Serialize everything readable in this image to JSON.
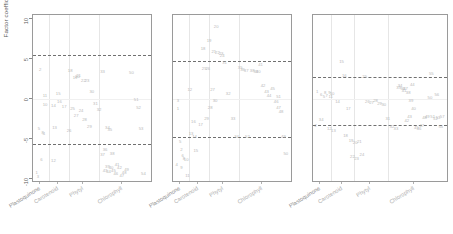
{
  "figure": {
    "ylabel": "Factor coefficient",
    "y_ticks": [
      "10",
      "5",
      "0",
      "-5",
      "-10"
    ],
    "y_tick_values": [
      10,
      5,
      0,
      -5,
      -10
    ],
    "ylim": [
      -10.5,
      10.5
    ],
    "x_categories": [
      "Plastoquinone",
      "Carotenoid",
      "Phytyl",
      "Chlorophyll"
    ],
    "panel_count": 3,
    "colors": {
      "point": "#b9b9b9",
      "frame": "#9a9a9a",
      "gridline": "#e6e6e6",
      "threshold_line": "#707070",
      "axis_text": "#5a5a5a",
      "xlabel_text": "#b0b0b0"
    }
  },
  "chart_data": {
    "type": "scatter",
    "title": "",
    "xlabel": "",
    "ylabel": "Factor coefficient",
    "ylim": [
      -10.5,
      10.5
    ],
    "grid": true,
    "legend": "none",
    "categories": [
      "Plastoquinone",
      "Carotenoid",
      "Phytyl",
      "Chlorophyll"
    ],
    "panels": [
      {
        "name": "Factor 1",
        "thresholds": [
          5.5,
          -5.6
        ],
        "points": [
          {
            "label": "2",
            "x": 0.06,
            "y": 3.6
          },
          {
            "label": "11",
            "x": 0.1,
            "y": 0.4
          },
          {
            "label": "10",
            "x": 0.1,
            "y": -0.8
          },
          {
            "label": "5",
            "x": 0.05,
            "y": -3.8
          },
          {
            "label": "1",
            "x": 0.03,
            "y": -9.2
          },
          {
            "label": "3",
            "x": 0.04,
            "y": -9.8
          },
          {
            "label": "6",
            "x": 0.07,
            "y": -7.6
          },
          {
            "label": "8",
            "x": 0.08,
            "y": -4.2
          },
          {
            "label": "4",
            "x": 0.09,
            "y": -4.4
          },
          {
            "label": "12",
            "x": 0.17,
            "y": -7.8
          },
          {
            "label": "13",
            "x": 0.18,
            "y": -3.6
          },
          {
            "label": "14",
            "x": 0.17,
            "y": -0.9
          },
          {
            "label": "15",
            "x": 0.21,
            "y": 0.6
          },
          {
            "label": "16",
            "x": 0.22,
            "y": -0.4
          },
          {
            "label": "17",
            "x": 0.26,
            "y": -1.0
          },
          {
            "label": "18",
            "x": 0.31,
            "y": 3.5
          },
          {
            "label": "19",
            "x": 0.35,
            "y": 2.6
          },
          {
            "label": "20",
            "x": 0.37,
            "y": 2.8
          },
          {
            "label": "21",
            "x": 0.38,
            "y": 2.9
          },
          {
            "label": "22",
            "x": 0.42,
            "y": 2.2
          },
          {
            "label": "23",
            "x": 0.45,
            "y": 2.3
          },
          {
            "label": "24",
            "x": 0.4,
            "y": -1.5
          },
          {
            "label": "25",
            "x": 0.33,
            "y": -1.3
          },
          {
            "label": "26",
            "x": 0.3,
            "y": -4.0
          },
          {
            "label": "27",
            "x": 0.36,
            "y": -2.1
          },
          {
            "label": "28",
            "x": 0.43,
            "y": -2.6
          },
          {
            "label": "29",
            "x": 0.47,
            "y": -3.5
          },
          {
            "label": "30",
            "x": 0.49,
            "y": 0.9
          },
          {
            "label": "31",
            "x": 0.52,
            "y": -0.6
          },
          {
            "label": "32",
            "x": 0.55,
            "y": -1.4
          },
          {
            "label": "33",
            "x": 0.58,
            "y": 3.4
          },
          {
            "label": "34",
            "x": 0.62,
            "y": -3.6
          },
          {
            "label": "35",
            "x": 0.64,
            "y": -3.9
          },
          {
            "label": "36",
            "x": 0.6,
            "y": -6.4
          },
          {
            "label": "37",
            "x": 0.58,
            "y": -7.0
          },
          {
            "label": "38",
            "x": 0.66,
            "y": -6.9
          },
          {
            "label": "39",
            "x": 0.62,
            "y": -8.5
          },
          {
            "label": "40",
            "x": 0.65,
            "y": -8.6
          },
          {
            "label": "41",
            "x": 0.7,
            "y": -8.3
          },
          {
            "label": "42",
            "x": 0.72,
            "y": -8.6
          },
          {
            "label": "43",
            "x": 0.6,
            "y": -9.0
          },
          {
            "label": "44",
            "x": 0.63,
            "y": -9.1
          },
          {
            "label": "45",
            "x": 0.67,
            "y": -9.0
          },
          {
            "label": "46",
            "x": 0.69,
            "y": -9.4
          },
          {
            "label": "47",
            "x": 0.74,
            "y": -9.6
          },
          {
            "label": "48",
            "x": 0.76,
            "y": -9.3
          },
          {
            "label": "49",
            "x": 0.78,
            "y": -8.9
          },
          {
            "label": "50",
            "x": 0.82,
            "y": 3.3
          },
          {
            "label": "51",
            "x": 0.86,
            "y": -0.1
          },
          {
            "label": "52",
            "x": 0.88,
            "y": -1.1
          },
          {
            "label": "53",
            "x": 0.9,
            "y": -3.7
          },
          {
            "label": "54",
            "x": 0.92,
            "y": -9.4
          }
        ]
      },
      {
        "name": "Factor 2",
        "thresholds": [
          4.7,
          -4.7
        ],
        "points": [
          {
            "label": "3",
            "x": 0.04,
            "y": -0.2
          },
          {
            "label": "1",
            "x": 0.04,
            "y": -1.3
          },
          {
            "label": "5",
            "x": 0.06,
            "y": -5.4
          },
          {
            "label": "2",
            "x": 0.07,
            "y": -6.4
          },
          {
            "label": "6",
            "x": 0.08,
            "y": -7.1
          },
          {
            "label": "4",
            "x": 0.03,
            "y": -8.2
          },
          {
            "label": "8",
            "x": 0.09,
            "y": -7.5
          },
          {
            "label": "9",
            "x": 0.07,
            "y": -8.6
          },
          {
            "label": "10",
            "x": 0.11,
            "y": -7.6
          },
          {
            "label": "11",
            "x": 0.12,
            "y": -9.6
          },
          {
            "label": "12",
            "x": 0.14,
            "y": 1.1
          },
          {
            "label": "13",
            "x": 0.15,
            "y": -4.4
          },
          {
            "label": "14",
            "x": 0.18,
            "y": -4.8
          },
          {
            "label": "15",
            "x": 0.19,
            "y": -6.5
          },
          {
            "label": "16",
            "x": 0.17,
            "y": -2.9
          },
          {
            "label": "17",
            "x": 0.23,
            "y": -3.3
          },
          {
            "label": "18",
            "x": 0.25,
            "y": 6.3
          },
          {
            "label": "19",
            "x": 0.3,
            "y": 7.3
          },
          {
            "label": "20",
            "x": 0.36,
            "y": 9.0
          },
          {
            "label": "21",
            "x": 0.34,
            "y": 5.9
          },
          {
            "label": "22",
            "x": 0.37,
            "y": 5.8
          },
          {
            "label": "23",
            "x": 0.4,
            "y": 5.6
          },
          {
            "label": "24",
            "x": 0.41,
            "y": 5.4
          },
          {
            "label": "25",
            "x": 0.26,
            "y": 3.8
          },
          {
            "label": "26",
            "x": 0.29,
            "y": 3.7
          },
          {
            "label": "27",
            "x": 0.33,
            "y": 1.1
          },
          {
            "label": "28",
            "x": 0.31,
            "y": -1.1
          },
          {
            "label": "29",
            "x": 0.28,
            "y": -2.5
          },
          {
            "label": "30",
            "x": 0.35,
            "y": -0.3
          },
          {
            "label": "31",
            "x": 0.43,
            "y": 4.5
          },
          {
            "label": "32",
            "x": 0.46,
            "y": 0.6
          },
          {
            "label": "33",
            "x": 0.5,
            "y": -2.5
          },
          {
            "label": "34",
            "x": 0.53,
            "y": -4.7
          },
          {
            "label": "35",
            "x": 0.56,
            "y": 3.9
          },
          {
            "label": "36",
            "x": 0.58,
            "y": 3.6
          },
          {
            "label": "37",
            "x": 0.61,
            "y": 3.5
          },
          {
            "label": "38",
            "x": 0.66,
            "y": 3.5
          },
          {
            "label": "39",
            "x": 0.69,
            "y": 3.4
          },
          {
            "label": "40",
            "x": 0.71,
            "y": 3.4
          },
          {
            "label": "41",
            "x": 0.73,
            "y": 4.3
          },
          {
            "label": "42",
            "x": 0.75,
            "y": 1.6
          },
          {
            "label": "43",
            "x": 0.78,
            "y": 0.9
          },
          {
            "label": "44",
            "x": 0.8,
            "y": 0.4
          },
          {
            "label": "45",
            "x": 0.83,
            "y": 1.3
          },
          {
            "label": "46",
            "x": 0.86,
            "y": -0.4
          },
          {
            "label": "47",
            "x": 0.88,
            "y": -1.1
          },
          {
            "label": "48",
            "x": 0.9,
            "y": -1.6
          },
          {
            "label": "49",
            "x": 0.92,
            "y": -4.8
          },
          {
            "label": "50",
            "x": 0.94,
            "y": -6.9
          },
          {
            "label": "51",
            "x": 0.88,
            "y": 0.3
          },
          {
            "label": "52",
            "x": 0.62,
            "y": -4.8
          }
        ]
      },
      {
        "name": "Factor 3",
        "thresholds": [
          2.8,
          -3.3
        ],
        "points": [
          {
            "label": "1",
            "x": 0.03,
            "y": 0.9
          },
          {
            "label": "2",
            "x": 0.02,
            "y": -3.4
          },
          {
            "label": "3",
            "x": 0.05,
            "y": -2.6
          },
          {
            "label": "4",
            "x": 0.07,
            "y": -2.6
          },
          {
            "label": "5",
            "x": 0.08,
            "y": 0.2
          },
          {
            "label": "6",
            "x": 0.06,
            "y": 0.5
          },
          {
            "label": "7",
            "x": 0.1,
            "y": 0.4
          },
          {
            "label": "8",
            "x": 0.09,
            "y": 0.8
          },
          {
            "label": "9",
            "x": 0.12,
            "y": 0.7
          },
          {
            "label": "10",
            "x": 0.14,
            "y": 0.6
          },
          {
            "label": "11",
            "x": 0.13,
            "y": 0.3
          },
          {
            "label": "12",
            "x": 0.12,
            "y": -3.8
          },
          {
            "label": "13",
            "x": 0.15,
            "y": -4.0
          },
          {
            "label": "14",
            "x": 0.18,
            "y": -0.4
          },
          {
            "label": "15",
            "x": 0.21,
            "y": 4.6
          },
          {
            "label": "16",
            "x": 0.23,
            "y": 2.9
          },
          {
            "label": "17",
            "x": 0.26,
            "y": -1.3
          },
          {
            "label": "18",
            "x": 0.24,
            "y": -4.6
          },
          {
            "label": "19",
            "x": 0.28,
            "y": -5.2
          },
          {
            "label": "20",
            "x": 0.31,
            "y": -5.5
          },
          {
            "label": "21",
            "x": 0.34,
            "y": -5.4
          },
          {
            "label": "22",
            "x": 0.29,
            "y": -7.3
          },
          {
            "label": "23",
            "x": 0.32,
            "y": -7.5
          },
          {
            "label": "24",
            "x": 0.36,
            "y": -7.0
          },
          {
            "label": "25",
            "x": 0.38,
            "y": 2.8
          },
          {
            "label": "26",
            "x": 0.4,
            "y": -0.4
          },
          {
            "label": "27",
            "x": 0.43,
            "y": -0.5
          },
          {
            "label": "28",
            "x": 0.46,
            "y": -0.3
          },
          {
            "label": "29",
            "x": 0.49,
            "y": -0.6
          },
          {
            "label": "30",
            "x": 0.52,
            "y": -0.8
          },
          {
            "label": "31",
            "x": 0.55,
            "y": -2.5
          },
          {
            "label": "32",
            "x": 0.58,
            "y": -3.5
          },
          {
            "label": "33",
            "x": 0.61,
            "y": -3.7
          },
          {
            "label": "34",
            "x": 0.64,
            "y": 1.6
          },
          {
            "label": "35",
            "x": 0.63,
            "y": 1.4
          },
          {
            "label": "36",
            "x": 0.66,
            "y": 1.2
          },
          {
            "label": "37",
            "x": 0.68,
            "y": 1.3
          },
          {
            "label": "38",
            "x": 0.7,
            "y": 0.7
          },
          {
            "label": "39",
            "x": 0.72,
            "y": -0.2
          },
          {
            "label": "40",
            "x": 0.74,
            "y": -1.3
          },
          {
            "label": "41",
            "x": 0.67,
            "y": 1.0
          },
          {
            "label": "42",
            "x": 0.69,
            "y": -2.8
          },
          {
            "label": "43",
            "x": 0.71,
            "y": -2.3
          },
          {
            "label": "44",
            "x": 0.73,
            "y": 1.8
          },
          {
            "label": "45",
            "x": 0.76,
            "y": -3.6
          },
          {
            "label": "46",
            "x": 0.78,
            "y": -3.7
          },
          {
            "label": "47",
            "x": 0.8,
            "y": -3.4
          },
          {
            "label": "48",
            "x": 0.82,
            "y": -2.4
          },
          {
            "label": "49",
            "x": 0.84,
            "y": -2.3
          },
          {
            "label": "50",
            "x": 0.86,
            "y": 0.1
          },
          {
            "label": "51",
            "x": 0.88,
            "y": -2.2
          },
          {
            "label": "52",
            "x": 0.9,
            "y": -2.5
          },
          {
            "label": "53",
            "x": 0.92,
            "y": -2.4
          },
          {
            "label": "54",
            "x": 0.94,
            "y": -3.5
          },
          {
            "label": "55",
            "x": 0.87,
            "y": 3.1
          },
          {
            "label": "56",
            "x": 0.91,
            "y": 0.5
          },
          {
            "label": "57",
            "x": 0.95,
            "y": -2.3
          }
        ]
      }
    ]
  }
}
